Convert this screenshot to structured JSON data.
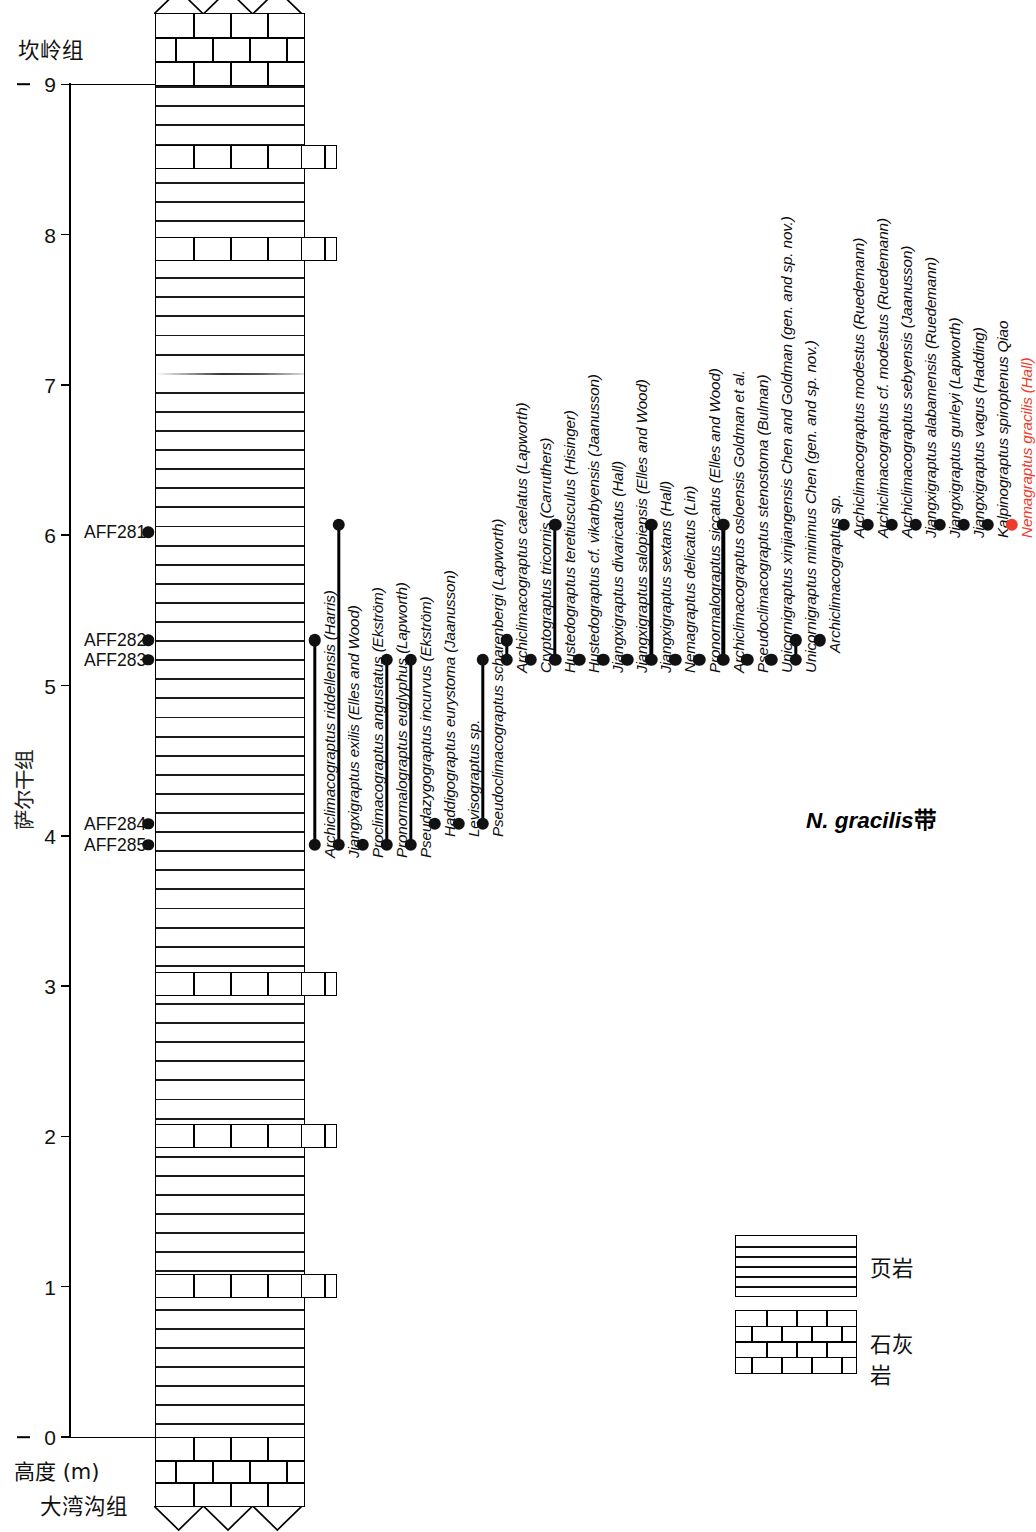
{
  "figure": {
    "type": "stratigraphic-range-chart",
    "height_axis_label": "高度 (m)",
    "formation_top": "坎岭组",
    "formation_middle": "萨尔干组",
    "formation_bottom": "大湾沟组",
    "zone_label_taxon": "N. gracilis",
    "zone_label_suffix": "带"
  },
  "axis": {
    "label": "高度 (m)",
    "unit": "m",
    "min": 0,
    "max": 9,
    "ticks": [
      0,
      1,
      2,
      3,
      4,
      5,
      6,
      7,
      8,
      9
    ],
    "tick_labels": [
      "0",
      "1",
      "2",
      "3",
      "4",
      "5",
      "6",
      "7",
      "8",
      "9"
    ],
    "marked_levels": [
      0,
      9
    ]
  },
  "samples": [
    {
      "label": "AFF281",
      "height": 6.02
    },
    {
      "label": "AFF282",
      "height": 5.3
    },
    {
      "label": "AFF283",
      "height": 5.17
    },
    {
      "label": "AFF284",
      "height": 4.08
    },
    {
      "label": "AFF285",
      "height": 3.94
    }
  ],
  "lithology": {
    "units": [
      {
        "rock": "limestone",
        "from": 9.0,
        "to": 9.6,
        "label": "石灰岩"
      },
      {
        "rock": "shale",
        "from": 0.0,
        "to": 9.0,
        "label": "页岩"
      },
      {
        "rock": "limestone",
        "from": -0.65,
        "to": 0.0,
        "label": "石灰岩"
      }
    ],
    "limestone_interbeds_in_shale": [
      8.52,
      7.91,
      3.02,
      2.01,
      1.01
    ],
    "unconformity_top": true,
    "unconformity_bottom": true
  },
  "legend": {
    "items": [
      {
        "pattern": "horizontal-lines",
        "label": "页岩"
      },
      {
        "pattern": "brick",
        "label": "石灰岩"
      }
    ]
  },
  "chart_data": {
    "type": "range-chart",
    "title": "",
    "xlabel": "",
    "ylabel": "高度 (m)",
    "ylim": [
      0,
      9
    ],
    "grid": false,
    "legend_position": "bottom-right",
    "accent_color": "#ef3b2c",
    "marker_color": "#111111",
    "categories": [
      "Archiclimacograptus riddellensis (Harris)",
      "Jiangxigraptus exilis (Elles and Wood)",
      "Proclimacograptus angustatus (Ekström)",
      "Pronormalograptus euglyphus (Lapworth)",
      "Pseudazygograptus incurvus (Ekström)",
      "Haddigograptus eurystoma (Jaanusson)",
      "Levisograptus sp.",
      "Pseudoclimacograptus scharenbergi (Lapworth)",
      "Archiclimacograptus caelatus (Lapworth)",
      "Cryptograptus tricornis (Carruthers)",
      "Hustedograptus teretiusculus (Hisinger)",
      "Hustedograptus cf. vikarbyensis (Jaanusson)",
      "Jiangxigraptus divaricatus (Hall)",
      "Jiangxigraptus salopiensis (Elles and Wood)",
      "Jiangxigraptus sextans (Hall)",
      "Nemagraptus delicatus (Lin)",
      "Pronormalograptus siccatus (Elles and Wood)",
      "Archiclimacograptus osloensis Goldman et al.",
      "Pseudoclimacograptus stenostoma (Bulman)",
      "Unicornigraptus xinjiangensis Chen and Goldman (gen. and sp. nov.)",
      "Unicornigraptus minimus Chen (gen. and sp. nov.)",
      "Archiclimacograptus sp.",
      "Archiclimacograptus modestus (Ruedemann)",
      "Archiclimacograptus cf. modestus (Ruedemann)",
      "Archiclimacograptus sebyensis (Jaanusson)",
      "Jiangxigraptus alabamensis (Ruedemann)",
      "Jiangxigraptus gurleyi (Lapworth)",
      "Jiangxigraptus vagus (Hadding)",
      "Kalpinograptus spiroptenus Qiao",
      "Nemagraptus gracilis (Hall)"
    ],
    "ranges": [
      {
        "taxon": "Archiclimacograptus riddellensis (Harris)",
        "base": 3.94,
        "top": 5.3,
        "highlight": false
      },
      {
        "taxon": "Jiangxigraptus exilis (Elles and Wood)",
        "base": 3.94,
        "top": 6.07,
        "highlight": false
      },
      {
        "taxon": "Proclimacograptus angustatus (Ekström)",
        "base": 3.94,
        "top": 3.94,
        "highlight": false
      },
      {
        "taxon": "Pronormalograptus euglyphus (Lapworth)",
        "base": 3.94,
        "top": 5.17,
        "highlight": false
      },
      {
        "taxon": "Pseudazygograptus incurvus (Ekström)",
        "base": 3.94,
        "top": 5.17,
        "highlight": false
      },
      {
        "taxon": "Haddigograptus eurystoma (Jaanusson)",
        "base": 4.08,
        "top": 4.08,
        "highlight": false
      },
      {
        "taxon": "Levisograptus sp.",
        "base": 4.08,
        "top": 4.08,
        "highlight": false
      },
      {
        "taxon": "Pseudoclimacograptus scharenbergi (Lapworth)",
        "base": 4.08,
        "top": 5.17,
        "highlight": false
      },
      {
        "taxon": "Archiclimacograptus caelatus (Lapworth)",
        "base": 5.17,
        "top": 5.3,
        "highlight": false
      },
      {
        "taxon": "Cryptograptus tricornis (Carruthers)",
        "base": 5.17,
        "top": 5.17,
        "highlight": false
      },
      {
        "taxon": "Hustedograptus teretiusculus (Hisinger)",
        "base": 5.17,
        "top": 6.07,
        "highlight": false
      },
      {
        "taxon": "Hustedograptus cf. vikarbyensis (Jaanusson)",
        "base": 5.17,
        "top": 5.17,
        "highlight": false
      },
      {
        "taxon": "Jiangxigraptus divaricatus (Hall)",
        "base": 5.17,
        "top": 5.17,
        "highlight": false
      },
      {
        "taxon": "Jiangxigraptus salopiensis (Elles and Wood)",
        "base": 5.17,
        "top": 5.17,
        "highlight": false
      },
      {
        "taxon": "Jiangxigraptus sextans (Hall)",
        "base": 5.17,
        "top": 6.07,
        "highlight": false
      },
      {
        "taxon": "Nemagraptus delicatus (Lin)",
        "base": 5.17,
        "top": 5.17,
        "highlight": false
      },
      {
        "taxon": "Pronormalograptus siccatus (Elles and Wood)",
        "base": 5.17,
        "top": 5.17,
        "highlight": false
      },
      {
        "taxon": "Archiclimacograptus osloensis Goldman et al.",
        "base": 5.17,
        "top": 6.07,
        "highlight": false
      },
      {
        "taxon": "Pseudoclimacograptus stenostoma (Bulman)",
        "base": 5.17,
        "top": 5.17,
        "highlight": false
      },
      {
        "taxon": "Unicornigraptus xinjiangensis Chen and Goldman (gen. and sp. nov.)",
        "base": 5.17,
        "top": 5.17,
        "highlight": false
      },
      {
        "taxon": "Unicornigraptus minimus Chen (gen. and sp. nov.)",
        "base": 5.17,
        "top": 5.3,
        "highlight": false
      },
      {
        "taxon": "Archiclimacograptus sp.",
        "base": 5.3,
        "top": 5.3,
        "highlight": false
      },
      {
        "taxon": "Archiclimacograptus modestus (Ruedemann)",
        "base": 6.07,
        "top": 6.07,
        "highlight": false
      },
      {
        "taxon": "Archiclimacograptus cf. modestus (Ruedemann)",
        "base": 6.07,
        "top": 6.07,
        "highlight": false
      },
      {
        "taxon": "Archiclimacograptus sebyensis (Jaanusson)",
        "base": 6.07,
        "top": 6.07,
        "highlight": false
      },
      {
        "taxon": "Jiangxigraptus alabamensis (Ruedemann)",
        "base": 6.07,
        "top": 6.07,
        "highlight": false
      },
      {
        "taxon": "Jiangxigraptus gurleyi (Lapworth)",
        "base": 6.07,
        "top": 6.07,
        "highlight": false
      },
      {
        "taxon": "Jiangxigraptus vagus (Hadding)",
        "base": 6.07,
        "top": 6.07,
        "highlight": false
      },
      {
        "taxon": "Kalpinograptus spiroptenus Qiao",
        "base": 6.07,
        "top": 6.07,
        "highlight": false
      },
      {
        "taxon": "Nemagraptus gracilis (Hall)",
        "base": 6.07,
        "top": 6.07,
        "highlight": true
      }
    ]
  }
}
